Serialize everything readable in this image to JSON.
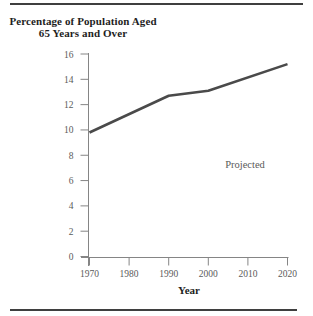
{
  "title": {
    "line1": "Percentage of Population Aged",
    "line2": "65 Years and Over"
  },
  "chart_data": {
    "type": "line",
    "title": "Percentage of Population Aged 65 Years and Over",
    "xlabel": "Year",
    "ylabel": "",
    "series_name": "Percentage of population aged 65 and over",
    "x": [
      1970,
      1990,
      2000,
      2020
    ],
    "values": [
      9.8,
      12.7,
      13.1,
      15.2
    ],
    "xticks": [
      1970,
      1980,
      1990,
      2000,
      2010,
      2020
    ],
    "yticks": [
      0,
      2,
      4,
      6,
      8,
      10,
      12,
      14,
      16
    ],
    "xlim": [
      1970,
      2020
    ],
    "ylim": [
      0,
      16
    ],
    "grid": false,
    "legend": "none",
    "annotation": "Projected"
  },
  "colors": {
    "rule": "#3f3f3f",
    "axis": "#858585",
    "tick": "#858585",
    "data_line": "#4a4a4a",
    "tick_label": "#5a5a5a",
    "title_text": "#1e1e1e",
    "annotation_text": "#5a5a5a",
    "background": "#ffffff"
  }
}
